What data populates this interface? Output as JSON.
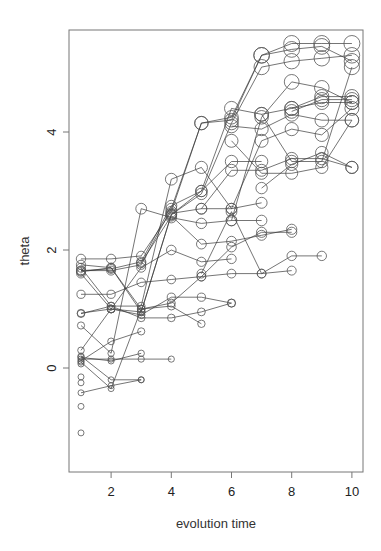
{
  "chart_data": {
    "type": "line",
    "title": "",
    "xlabel": "evolution time",
    "ylabel": "theta",
    "xlim": [
      0.7,
      10.35
    ],
    "ylim": [
      -1.35,
      5.75
    ],
    "x_ticks": [
      2,
      4,
      6,
      8,
      10
    ],
    "y_ticks": [
      0,
      2,
      4
    ],
    "grid": false,
    "legend": "none",
    "marker": "open-circle",
    "marker_size_note": "circle radius grows with theta level",
    "series": [
      {
        "name": "traj-1",
        "points": [
          [
            1,
            1.85
          ],
          [
            2,
            1.85
          ],
          [
            3,
            1.9
          ],
          [
            4,
            2.65
          ],
          [
            5,
            4.15
          ],
          [
            6,
            4.25
          ],
          [
            7,
            5.3
          ],
          [
            8,
            5.5
          ],
          [
            9,
            5.5
          ],
          [
            10,
            5.5
          ]
        ]
      },
      {
        "name": "traj-2",
        "points": [
          [
            1,
            1.65
          ],
          [
            2,
            1.65
          ],
          [
            3,
            1.75
          ],
          [
            4,
            2.7
          ],
          [
            5,
            4.15
          ],
          [
            6,
            4.2
          ],
          [
            7,
            5.3
          ],
          [
            8,
            5.4
          ],
          [
            9,
            5.45
          ],
          [
            10,
            5.2
          ]
        ]
      },
      {
        "name": "traj-3",
        "points": [
          [
            1,
            1.63
          ],
          [
            2,
            1.7
          ],
          [
            3,
            0.95
          ],
          [
            4,
            2.6
          ],
          [
            5,
            2.95
          ],
          [
            6,
            4.15
          ],
          [
            7,
            5.1
          ],
          [
            8,
            5.2
          ],
          [
            9,
            5.25
          ],
          [
            10,
            5.3
          ]
        ]
      },
      {
        "name": "traj-4",
        "points": [
          [
            1,
            1.65
          ],
          [
            2,
            1.68
          ],
          [
            3,
            1.8
          ],
          [
            4,
            2.75
          ],
          [
            5,
            3.0
          ],
          [
            6,
            4.4
          ],
          [
            7,
            4.3
          ],
          [
            8,
            4.4
          ],
          [
            9,
            4.6
          ],
          [
            10,
            4.6
          ]
        ]
      },
      {
        "name": "traj-5",
        "points": [
          [
            1,
            1.25
          ],
          [
            2,
            1.25
          ],
          [
            3,
            1.45
          ],
          [
            4,
            1.5
          ],
          [
            5,
            1.55
          ],
          [
            6,
            1.6
          ],
          [
            7,
            1.6
          ],
          [
            8,
            1.65
          ]
        ]
      },
      {
        "name": "traj-6",
        "points": [
          [
            1,
            0.92
          ],
          [
            2,
            1.05
          ],
          [
            3,
            1.05
          ],
          [
            4,
            3.2
          ],
          [
            5,
            3.4
          ],
          [
            6,
            2.7
          ],
          [
            7,
            2.8
          ]
        ]
      },
      {
        "name": "traj-7",
        "points": [
          [
            1,
            0.93
          ],
          [
            2,
            1.0
          ],
          [
            3,
            1.7
          ],
          [
            4,
            2.0
          ],
          [
            5,
            1.8
          ],
          [
            6,
            1.85
          ]
        ]
      },
      {
        "name": "traj-8",
        "points": [
          [
            1,
            0.72
          ],
          [
            2,
            0.25
          ],
          [
            3,
            2.7
          ],
          [
            4,
            2.55
          ],
          [
            5,
            2.45
          ],
          [
            6,
            2.5
          ],
          [
            7,
            2.5
          ]
        ]
      },
      {
        "name": "traj-9",
        "points": [
          [
            1,
            0.3
          ],
          [
            2,
            1.0
          ],
          [
            3,
            0.95
          ],
          [
            4,
            2.6
          ],
          [
            5,
            3.0
          ],
          [
            6,
            3.5
          ],
          [
            7,
            3.5
          ]
        ]
      },
      {
        "name": "traj-10",
        "points": [
          [
            1,
            0.15
          ],
          [
            2,
            0.15
          ],
          [
            3,
            0.15
          ],
          [
            4,
            0.15
          ]
        ]
      },
      {
        "name": "traj-11",
        "points": [
          [
            1,
            0.18
          ],
          [
            2,
            0.12
          ],
          [
            3,
            0.25
          ]
        ]
      },
      {
        "name": "traj-12",
        "points": [
          [
            1,
            0.12
          ],
          [
            2,
            0.45
          ],
          [
            3,
            0.62
          ]
        ]
      },
      {
        "name": "traj-13",
        "points": [
          [
            1,
            0.2
          ],
          [
            2,
            -0.2
          ],
          [
            3,
            -0.2
          ]
        ]
      },
      {
        "name": "traj-14",
        "points": [
          [
            1,
            -0.42
          ],
          [
            2,
            -0.3
          ],
          [
            3,
            -0.2
          ]
        ]
      },
      {
        "name": "traj-15",
        "points": [
          [
            1,
            1.7
          ],
          [
            2,
            1.05
          ],
          [
            3,
            0.85
          ],
          [
            4,
            0.85
          ],
          [
            5,
            0.95
          ],
          [
            6,
            1.1
          ]
        ]
      },
      {
        "name": "traj-16",
        "points": [
          [
            1,
            1.6
          ],
          [
            2,
            1.0
          ],
          [
            3,
            0.9
          ],
          [
            4,
            1.2
          ],
          [
            5,
            1.2
          ],
          [
            6,
            1.1
          ]
        ]
      },
      {
        "name": "traj-17",
        "points": [
          [
            1,
            0.1
          ],
          [
            2,
            -0.35
          ],
          [
            3,
            1.0
          ],
          [
            4,
            1.05
          ],
          [
            5,
            0.75
          ]
        ]
      },
      {
        "name": "traj-18",
        "points": [
          [
            1,
            1.75
          ],
          [
            2,
            1.7
          ],
          [
            3,
            1.0
          ],
          [
            4,
            1.1
          ],
          [
            5,
            1.55
          ],
          [
            6,
            2.05
          ],
          [
            7,
            2.3
          ],
          [
            8,
            2.3
          ]
        ]
      },
      {
        "name": "traj-19",
        "points": [
          [
            3,
            1.78
          ],
          [
            4,
            2.58
          ],
          [
            5,
            2.1
          ],
          [
            6,
            2.15
          ],
          [
            7,
            2.25
          ],
          [
            8,
            2.35
          ]
        ]
      },
      {
        "name": "traj-20",
        "points": [
          [
            5,
            1.6
          ],
          [
            6,
            2.65
          ],
          [
            7,
            1.6
          ],
          [
            8,
            1.9
          ],
          [
            9,
            1.9
          ]
        ]
      },
      {
        "name": "traj-21",
        "points": [
          [
            4,
            2.62
          ],
          [
            5,
            2.7
          ],
          [
            6,
            2.7
          ],
          [
            7,
            3.85
          ],
          [
            8,
            4.05
          ],
          [
            9,
            3.95
          ],
          [
            10,
            4.4
          ]
        ]
      },
      {
        "name": "traj-22",
        "points": [
          [
            5,
            2.7
          ],
          [
            6,
            3.35
          ],
          [
            7,
            3.35
          ],
          [
            8,
            3.55
          ],
          [
            9,
            3.55
          ],
          [
            10,
            3.4
          ]
        ]
      },
      {
        "name": "traj-23",
        "points": [
          [
            6,
            3.85
          ],
          [
            7,
            3.3
          ],
          [
            8,
            3.3
          ],
          [
            9,
            3.4
          ],
          [
            10,
            4.2
          ]
        ]
      },
      {
        "name": "traj-24",
        "points": [
          [
            6,
            4.1
          ],
          [
            7,
            4.05
          ],
          [
            8,
            4.3
          ],
          [
            9,
            4.2
          ],
          [
            10,
            4.2
          ]
        ]
      },
      {
        "name": "traj-25",
        "points": [
          [
            6,
            2.5
          ],
          [
            7,
            4.25
          ],
          [
            8,
            4.85
          ],
          [
            9,
            4.75
          ],
          [
            10,
            4.5
          ]
        ]
      },
      {
        "name": "traj-26",
        "points": [
          [
            7,
            4.3
          ],
          [
            8,
            3.5
          ],
          [
            9,
            3.5
          ],
          [
            10,
            5.1
          ]
        ]
      },
      {
        "name": "traj-27",
        "points": [
          [
            7,
            3.05
          ],
          [
            8,
            3.45
          ],
          [
            9,
            3.65
          ],
          [
            10,
            3.4
          ]
        ]
      },
      {
        "name": "traj-28",
        "points": [
          [
            8,
            4.35
          ],
          [
            9,
            4.55
          ],
          [
            10,
            4.55
          ]
        ]
      },
      {
        "name": "traj-29",
        "points": [
          [
            8,
            4.4
          ],
          [
            9,
            4.5
          ],
          [
            10,
            4.5
          ]
        ]
      }
    ],
    "isolated_points": [
      [
        1,
        -0.65
      ],
      [
        1,
        -1.1
      ],
      [
        1,
        -0.25
      ],
      [
        1,
        -0.15
      ],
      [
        1,
        0.07
      ]
    ]
  }
}
